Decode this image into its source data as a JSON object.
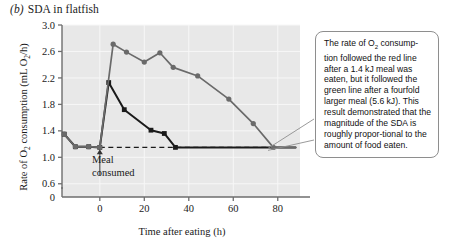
{
  "figure": {
    "panel_letter": "(b)",
    "title": "SDA in flatfish"
  },
  "axes": {
    "y_label_pre": "Rate of O",
    "y_label_sub1": "2",
    "y_label_mid": " consumption (mL O",
    "y_label_sub2": "2",
    "y_label_post": "/h)",
    "x_label": "Time after eating (h)",
    "y_ticks": [
      "0",
      "0.6",
      "1.0",
      "1.4",
      "1.8",
      "2.2",
      "2.6",
      "3.0"
    ],
    "x_ticks": [
      "0",
      "20",
      "40",
      "60",
      "80"
    ],
    "x_range": [
      -17,
      90
    ],
    "y_range": [
      0.4,
      3.0
    ],
    "grid": true,
    "plot_bg": "#e8e8e8",
    "grid_color": "#f7f7f7",
    "axis_color": "#6e6e6e"
  },
  "annotations": {
    "meal_marker_label_line1": "Meal",
    "meal_marker_label_line2": "consumed",
    "meal_marker_x": 0,
    "baseline_value": 1.15,
    "callout_text": "The rate of O2 consumption followed the red line after a 1.4 kJ meal was eaten, but it followed the green line after a fourfold larger meal (5.6 kJ). This result demonstrated that the magnitude of the SDA is roughly proportional to the amount of food eaten.",
    "callout_line1a": "The rate of O",
    "callout_line1b": " consump-",
    "callout_rest": "tion followed the red line after a 1.4 kJ meal was eaten, but it followed the green line after a fourfold larger meal (5.6 kJ). This result demonstrated that the magnitude of the SDA is roughly propor-tional to the amount of food eaten."
  },
  "chart_data": {
    "type": "line",
    "title": "SDA in flatfish",
    "xlabel": "Time after eating (h)",
    "ylabel": "Rate of O2 consumption (mL O2/h)",
    "xlim": [
      -17,
      90
    ],
    "ylim": [
      0.4,
      3.0
    ],
    "grid": true,
    "legend": "none",
    "baseline": {
      "value": 1.15,
      "style": "dashed",
      "color": "#1a1a1a",
      "x_start": 0,
      "x_end": 78
    },
    "series": [
      {
        "name": "small meal (1.4 kJ)",
        "color": "#1a1a1a",
        "marker": "square",
        "points": [
          {
            "x": -16,
            "y": 1.35
          },
          {
            "x": -11,
            "y": 1.16
          },
          {
            "x": -5,
            "y": 1.16
          },
          {
            "x": 0,
            "y": 1.15
          },
          {
            "x": 4,
            "y": 2.13
          },
          {
            "x": 11,
            "y": 1.72
          },
          {
            "x": 23,
            "y": 1.41
          },
          {
            "x": 29,
            "y": 1.36
          },
          {
            "x": 34,
            "y": 1.15
          },
          {
            "x": 88,
            "y": 1.15
          }
        ]
      },
      {
        "name": "large meal (5.6 kJ)",
        "color": "#6a6a6a",
        "marker": "circle",
        "points": [
          {
            "x": -16,
            "y": 1.35
          },
          {
            "x": -11,
            "y": 1.16
          },
          {
            "x": -5,
            "y": 1.16
          },
          {
            "x": 0,
            "y": 1.15
          },
          {
            "x": 6,
            "y": 2.71
          },
          {
            "x": 12,
            "y": 2.59
          },
          {
            "x": 20,
            "y": 2.44
          },
          {
            "x": 27,
            "y": 2.58
          },
          {
            "x": 33,
            "y": 2.36
          },
          {
            "x": 44,
            "y": 2.23
          },
          {
            "x": 58,
            "y": 1.88
          },
          {
            "x": 69,
            "y": 1.51
          },
          {
            "x": 78,
            "y": 1.15
          },
          {
            "x": 88,
            "y": 1.15
          }
        ]
      }
    ]
  }
}
